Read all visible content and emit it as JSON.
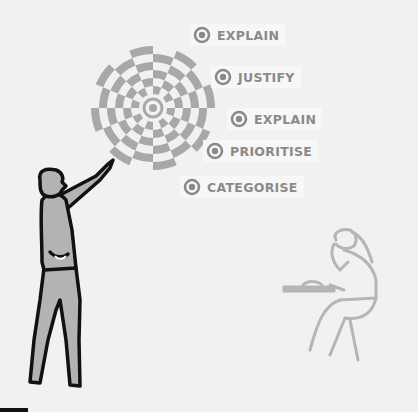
{
  "labels": [
    {
      "text": "EXPLAIN",
      "x": 190,
      "y": 24
    },
    {
      "text": "JUSTIFY",
      "x": 211,
      "y": 66
    },
    {
      "text": "EXPLAIN",
      "x": 227,
      "y": 108
    },
    {
      "text": "PRIORITISE",
      "x": 203,
      "y": 140
    },
    {
      "text": "CATEGORISE",
      "x": 180,
      "y": 176
    }
  ],
  "colors": {
    "background": "#f1f1f1",
    "target_gray": "#a8a8a8",
    "label_text": "#8a8a8a",
    "figure_fill": "#b3b3b3",
    "outline": "#111111",
    "seated_figure": "#b5b5b5"
  }
}
